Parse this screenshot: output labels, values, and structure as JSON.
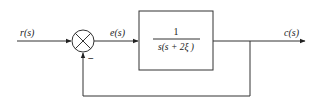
{
  "diagram": {
    "type": "feedback-block-diagram",
    "signals": {
      "input": "r(s)",
      "error": "e(s)",
      "output": "c(s)"
    },
    "summing_junction": {
      "feedback_sign": "−"
    },
    "block": {
      "numerator": "1",
      "denominator": "s(s + 2ξ )"
    },
    "feedback": "unity"
  }
}
